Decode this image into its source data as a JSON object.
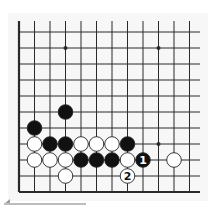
{
  "diagram": {
    "type": "go-board-fragment",
    "columns": 12,
    "rows": 11,
    "edges": [
      "left",
      "bottom"
    ],
    "star_points": [
      {
        "col": 3,
        "row": 1
      },
      {
        "col": 9,
        "row": 1
      },
      {
        "col": 9,
        "row": 7
      }
    ],
    "stones": [
      {
        "color": "black",
        "col": 3,
        "row": 5,
        "label": ""
      },
      {
        "color": "black",
        "col": 1,
        "row": 6,
        "label": ""
      },
      {
        "color": "white",
        "col": 1,
        "row": 7,
        "label": ""
      },
      {
        "color": "black",
        "col": 2,
        "row": 7,
        "label": ""
      },
      {
        "color": "black",
        "col": 3,
        "row": 7,
        "label": ""
      },
      {
        "color": "white",
        "col": 4,
        "row": 7,
        "label": ""
      },
      {
        "color": "white",
        "col": 5,
        "row": 7,
        "label": ""
      },
      {
        "color": "white",
        "col": 6,
        "row": 7,
        "label": ""
      },
      {
        "color": "black",
        "col": 7,
        "row": 7,
        "label": ""
      },
      {
        "color": "white",
        "col": 1,
        "row": 8,
        "label": ""
      },
      {
        "color": "white",
        "col": 2,
        "row": 8,
        "label": ""
      },
      {
        "color": "white",
        "col": 3,
        "row": 8,
        "label": ""
      },
      {
        "color": "black",
        "col": 4,
        "row": 8,
        "label": ""
      },
      {
        "color": "black",
        "col": 5,
        "row": 8,
        "label": ""
      },
      {
        "color": "black",
        "col": 6,
        "row": 8,
        "label": ""
      },
      {
        "color": "white",
        "col": 7,
        "row": 8,
        "label": ""
      },
      {
        "color": "black",
        "col": 8,
        "row": 8,
        "label": "1"
      },
      {
        "color": "white",
        "col": 10,
        "row": 8,
        "label": ""
      },
      {
        "color": "white",
        "col": 3,
        "row": 9,
        "label": ""
      },
      {
        "color": "white",
        "col": 7,
        "row": 9,
        "label": "2"
      }
    ],
    "colors": {
      "line": "#2a2a2a",
      "black_stone": "#111111",
      "white_stone": "#ffffff",
      "stone_outline": "#222222"
    }
  }
}
